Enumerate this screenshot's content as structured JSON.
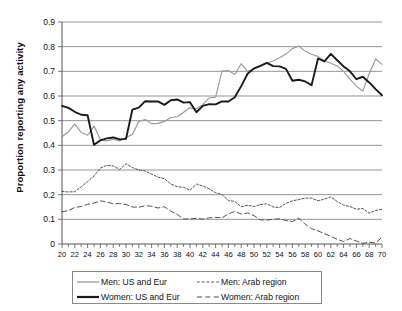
{
  "chart_data": {
    "type": "line",
    "title": "",
    "xlabel": "",
    "ylabel": "Proportion reporting any activity",
    "xlim": [
      20,
      70
    ],
    "ylim": [
      0,
      0.9
    ],
    "grid": "horizontal",
    "legend_position": "bottom",
    "xticks": [
      20,
      22,
      24,
      26,
      28,
      30,
      32,
      34,
      36,
      38,
      40,
      42,
      44,
      46,
      48,
      50,
      52,
      54,
      56,
      58,
      60,
      62,
      64,
      66,
      68,
      70
    ],
    "xtick_labels": [
      "20",
      "22",
      "24",
      "26",
      "28",
      "30",
      "32",
      "34",
      "36",
      "38",
      "40",
      "42",
      "44",
      "46",
      "48",
      "50",
      "52",
      "54",
      "56",
      "58",
      "60",
      "62",
      "64",
      "66",
      "68",
      "70"
    ],
    "yticks": [
      0,
      0.1,
      0.2,
      0.3,
      0.4,
      0.5,
      0.6,
      0.7,
      0.8,
      0.9
    ],
    "ytick_labels": [
      "0",
      "0.1",
      "0.2",
      "0.3",
      "0.4",
      "0.5",
      "0.6",
      "0.7",
      "0.8",
      "0.9"
    ],
    "x": [
      20,
      21,
      22,
      23,
      24,
      25,
      26,
      27,
      28,
      29,
      30,
      31,
      32,
      33,
      34,
      35,
      36,
      37,
      38,
      39,
      40,
      41,
      42,
      43,
      44,
      45,
      46,
      47,
      48,
      49,
      50,
      51,
      52,
      53,
      54,
      55,
      56,
      57,
      58,
      59,
      60,
      61,
      62,
      63,
      64,
      65,
      66,
      67,
      68,
      69,
      70
    ],
    "series": [
      {
        "name": "Men: US and Eur",
        "style": "solid-gray",
        "color": "#9a9a9a",
        "values": [
          0.435,
          0.455,
          0.487,
          0.452,
          0.441,
          0.478,
          0.424,
          0.418,
          0.425,
          0.418,
          0.432,
          0.444,
          0.497,
          0.505,
          0.488,
          0.489,
          0.497,
          0.513,
          0.516,
          0.534,
          0.552,
          0.548,
          0.565,
          0.592,
          0.595,
          0.701,
          0.703,
          0.687,
          0.731,
          0.7,
          0.71,
          0.721,
          0.733,
          0.742,
          0.755,
          0.77,
          0.792,
          0.803,
          0.782,
          0.769,
          0.76,
          0.742,
          0.733,
          0.722,
          0.7,
          0.668,
          0.64,
          0.62,
          0.69,
          0.75,
          0.728
        ]
      },
      {
        "name": "Women: US and Eur",
        "style": "solid-black",
        "color": "#1a1a1a",
        "values": [
          0.56,
          0.552,
          0.536,
          0.524,
          0.522,
          0.402,
          0.42,
          0.428,
          0.432,
          0.424,
          0.426,
          0.545,
          0.553,
          0.579,
          0.578,
          0.578,
          0.564,
          0.583,
          0.586,
          0.573,
          0.575,
          0.534,
          0.56,
          0.567,
          0.566,
          0.578,
          0.578,
          0.595,
          0.64,
          0.69,
          0.712,
          0.722,
          0.734,
          0.721,
          0.72,
          0.71,
          0.662,
          0.666,
          0.659,
          0.644,
          0.752,
          0.74,
          0.771,
          0.745,
          0.72,
          0.7,
          0.668,
          0.678,
          0.655,
          0.628,
          0.603
        ]
      },
      {
        "name": "Men: Arab region",
        "style": "dotted",
        "color": "#4a4a4a",
        "values": [
          0.213,
          0.211,
          0.212,
          0.232,
          0.253,
          0.276,
          0.308,
          0.319,
          0.317,
          0.302,
          0.325,
          0.31,
          0.3,
          0.296,
          0.283,
          0.271,
          0.265,
          0.243,
          0.232,
          0.23,
          0.218,
          0.243,
          0.235,
          0.224,
          0.208,
          0.201,
          0.176,
          0.173,
          0.151,
          0.157,
          0.152,
          0.16,
          0.163,
          0.15,
          0.148,
          0.165,
          0.175,
          0.18,
          0.186,
          0.186,
          0.175,
          0.182,
          0.191,
          0.172,
          0.158,
          0.152,
          0.141,
          0.144,
          0.125,
          0.136,
          0.141
        ]
      },
      {
        "name": "Women: Arab region",
        "style": "dashed",
        "color": "#4a4a4a",
        "values": [
          0.13,
          0.136,
          0.148,
          0.152,
          0.161,
          0.166,
          0.175,
          0.17,
          0.163,
          0.164,
          0.16,
          0.15,
          0.149,
          0.155,
          0.153,
          0.146,
          0.151,
          0.133,
          0.12,
          0.101,
          0.102,
          0.104,
          0.101,
          0.106,
          0.108,
          0.106,
          0.122,
          0.132,
          0.121,
          0.126,
          0.115,
          0.098,
          0.097,
          0.1,
          0.102,
          0.095,
          0.091,
          0.105,
          0.08,
          0.062,
          0.053,
          0.042,
          0.031,
          0.019,
          0.01,
          0.022,
          0.012,
          0.003,
          0.007,
          0.004,
          0.028
        ]
      }
    ]
  },
  "legend": {
    "items": [
      {
        "label": "Men: US and Eur",
        "style": "solid-gray"
      },
      {
        "label": "Men: Arab region",
        "style": "dotted"
      },
      {
        "label": "Women: US and Eur",
        "style": "solid-black"
      },
      {
        "label": "Women: Arab region",
        "style": "dashed"
      }
    ]
  }
}
